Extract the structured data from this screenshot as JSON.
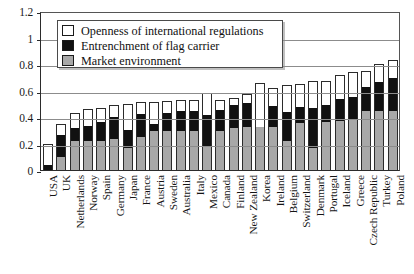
{
  "chart_data": {
    "type": "bar",
    "subtype": "stacked-vertical",
    "title": "",
    "xlabel": "",
    "ylabel": "",
    "ylim": [
      0,
      1.2
    ],
    "yticks": [
      "0",
      "0.2",
      "0.4",
      "0.6",
      "0.8",
      "1",
      "1.2"
    ],
    "ytick_values": [
      0,
      0.2,
      0.4,
      0.6,
      0.8,
      1,
      1.2
    ],
    "grid": "horizontal",
    "legend_position": "top-left-inside",
    "stack_order_bottom_to_top": [
      "Market environment",
      "Entrenchment of flag carrier",
      "Openness of international regulations"
    ],
    "categories": [
      "USA",
      "UK",
      "Netherlands",
      "Norway",
      "Spain",
      "Germany",
      "Japan",
      "France",
      "Austria",
      "Sweden",
      "Australia",
      "Italy",
      "Mexico",
      "Canada",
      "Finland",
      "New Zealand",
      "Korea",
      "Ireland",
      "Belgium",
      "Switzerland",
      "Denmark",
      "Portugal",
      "Iceland",
      "Greece",
      "Czech Republic",
      "Turkey",
      "Poland"
    ],
    "series": [
      {
        "name": "Market environment",
        "color": "#a8a8a8",
        "values": [
          0.0,
          0.1,
          0.22,
          0.22,
          0.22,
          0.24,
          0.17,
          0.25,
          0.3,
          0.3,
          0.3,
          0.3,
          0.18,
          0.3,
          0.32,
          0.33,
          0.33,
          0.33,
          0.22,
          0.36,
          0.17,
          0.37,
          0.37,
          0.38,
          0.45,
          0.45,
          0.45
        ]
      },
      {
        "name": "Entrenchment of flag carrier",
        "color": "#111111",
        "values": [
          0.04,
          0.17,
          0.1,
          0.12,
          0.15,
          0.17,
          0.14,
          0.18,
          0.05,
          0.14,
          0.15,
          0.15,
          0.24,
          0.16,
          0.18,
          0.18,
          0.0,
          0.16,
          0.22,
          0.12,
          0.3,
          0.13,
          0.17,
          0.18,
          0.18,
          0.22,
          0.25
        ]
      },
      {
        "name": "Openness of international regulations",
        "color": "#ffffff",
        "values": [
          0.16,
          0.08,
          0.11,
          0.12,
          0.1,
          0.08,
          0.19,
          0.08,
          0.16,
          0.08,
          0.08,
          0.08,
          0.16,
          0.07,
          0.04,
          0.06,
          0.33,
          0.13,
          0.2,
          0.17,
          0.2,
          0.17,
          0.18,
          0.18,
          0.12,
          0.13,
          0.13
        ]
      }
    ],
    "totals": [
      0.2,
      0.35,
      0.43,
      0.46,
      0.47,
      0.49,
      0.5,
      0.51,
      0.51,
      0.52,
      0.53,
      0.53,
      0.58,
      0.53,
      0.54,
      0.57,
      0.66,
      0.62,
      0.64,
      0.65,
      0.67,
      0.67,
      0.72,
      0.74,
      0.75,
      0.8,
      0.83
    ]
  },
  "legend": {
    "items": [
      {
        "label": "Openness of international regulations",
        "key": "openness"
      },
      {
        "label": "Entrenchment of flag carrier",
        "key": "entrench"
      },
      {
        "label": "Market environment",
        "key": "market"
      }
    ]
  }
}
